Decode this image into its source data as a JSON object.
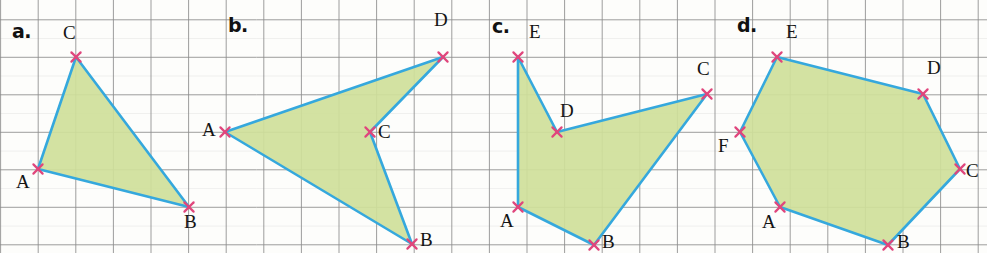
{
  "figure": {
    "background_color": "#fdfdfb",
    "grid": {
      "color": "#8d8d8d",
      "minor_color": "#cfcfcf",
      "spacing_x": 37.6,
      "spacing_y": 37.5,
      "origin_x": 0.6,
      "origin_y": 19.8
    },
    "style": {
      "outline_color": "#35a8dd",
      "fill_color": "#cfe09a",
      "vertex_marker_color": "#e0467c",
      "vertex_marker": "x-cross",
      "outline_width": 2.6
    }
  },
  "panels": [
    {
      "id": "a",
      "label": "a.",
      "label_pos": {
        "x": 12,
        "y": 20
      },
      "shape": "triangle",
      "vertices": [
        {
          "name": "A",
          "x": 38,
          "y": 169,
          "label_pos": {
            "x": 16,
            "y": 172
          }
        },
        {
          "name": "B",
          "x": 189,
          "y": 207,
          "label_pos": {
            "x": 184,
            "y": 212
          }
        },
        {
          "name": "C",
          "x": 76,
          "y": 57,
          "label_pos": {
            "x": 63,
            "y": 23
          }
        }
      ],
      "order": [
        "A",
        "C",
        "B"
      ]
    },
    {
      "id": "b",
      "label": "b.",
      "label_pos": {
        "x": 228,
        "y": 14
      },
      "shape": "quadrilateral-concave",
      "vertices": [
        {
          "name": "A",
          "x": 225,
          "y": 132,
          "label_pos": {
            "x": 202,
            "y": 120
          }
        },
        {
          "name": "B",
          "x": 412,
          "y": 244,
          "label_pos": {
            "x": 420,
            "y": 230
          }
        },
        {
          "name": "C",
          "x": 370,
          "y": 132,
          "label_pos": {
            "x": 378,
            "y": 122
          }
        },
        {
          "name": "D",
          "x": 443,
          "y": 57,
          "label_pos": {
            "x": 434,
            "y": 10
          }
        }
      ],
      "order": [
        "A",
        "D",
        "C",
        "B"
      ]
    },
    {
      "id": "c",
      "label": "c.",
      "label_pos": {
        "x": 492,
        "y": 15
      },
      "shape": "pentagon-concave",
      "vertices": [
        {
          "name": "A",
          "x": 518,
          "y": 207,
          "label_pos": {
            "x": 500,
            "y": 211
          }
        },
        {
          "name": "B",
          "x": 594,
          "y": 245,
          "label_pos": {
            "x": 602,
            "y": 232
          }
        },
        {
          "name": "C",
          "x": 707,
          "y": 94,
          "label_pos": {
            "x": 697,
            "y": 59
          }
        },
        {
          "name": "D",
          "x": 557,
          "y": 132,
          "label_pos": {
            "x": 560,
            "y": 101
          }
        },
        {
          "name": "E",
          "x": 518,
          "y": 57,
          "label_pos": {
            "x": 529,
            "y": 22
          }
        }
      ],
      "order": [
        "A",
        "E",
        "D",
        "C",
        "B"
      ]
    },
    {
      "id": "d",
      "label": "d.",
      "label_pos": {
        "x": 737,
        "y": 14
      },
      "shape": "hexagon-convex",
      "vertices": [
        {
          "name": "A",
          "x": 780,
          "y": 207,
          "label_pos": {
            "x": 762,
            "y": 212
          }
        },
        {
          "name": "B",
          "x": 888,
          "y": 245,
          "label_pos": {
            "x": 897,
            "y": 232
          }
        },
        {
          "name": "C",
          "x": 960,
          "y": 169,
          "label_pos": {
            "x": 966,
            "y": 161
          }
        },
        {
          "name": "D",
          "x": 923,
          "y": 94,
          "label_pos": {
            "x": 927,
            "y": 58
          }
        },
        {
          "name": "E",
          "x": 777,
          "y": 57,
          "label_pos": {
            "x": 786,
            "y": 22
          }
        },
        {
          "name": "F",
          "x": 740,
          "y": 132,
          "label_pos": {
            "x": 718,
            "y": 136
          }
        }
      ],
      "order": [
        "A",
        "F",
        "E",
        "D",
        "C",
        "B"
      ]
    }
  ]
}
